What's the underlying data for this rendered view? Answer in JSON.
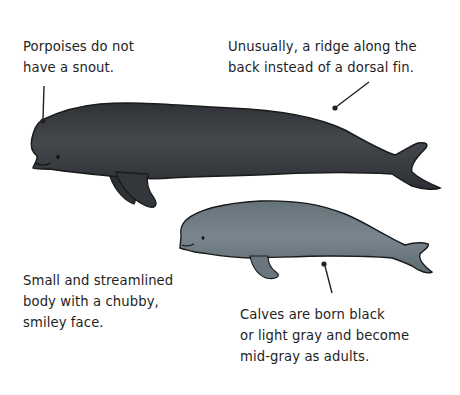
{
  "diagram": {
    "colors": {
      "adult_body": "#3a3d42",
      "calf_body": "#707c84",
      "outline": "#1a1a1a",
      "leader_line": "#222222"
    },
    "annotations": {
      "snout": {
        "lines": [
          "Porpoises do not",
          "have a snout."
        ]
      },
      "ridge": {
        "lines": [
          "Unusually, a ridge along the",
          "back instead of a dorsal fin."
        ]
      },
      "body": {
        "lines": [
          "Small and streamlined",
          "body with a chubby,",
          "smiley face."
        ]
      },
      "calves": {
        "lines": [
          "Calves are born black",
          "or light gray and become",
          "mid-gray as adults."
        ]
      }
    },
    "figures": [
      {
        "name": "adult-porpoise",
        "label": "adult"
      },
      {
        "name": "calf-porpoise",
        "label": "calf"
      }
    ]
  }
}
